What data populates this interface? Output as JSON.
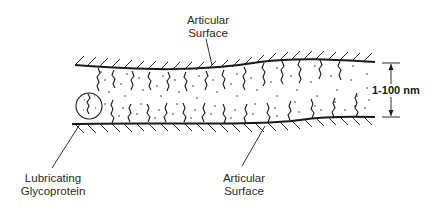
{
  "diagram": {
    "type": "boundary-lubrication-cross-section",
    "labels": {
      "top_surface": [
        "Articular",
        "Surface"
      ],
      "bottom_surface": [
        "Articular",
        "Surface"
      ],
      "glycoprotein": [
        "Lubricating",
        "Glycoprotein"
      ],
      "gap_dimension": "1-100 nm"
    },
    "colors": {
      "ink": "#1a1a1a",
      "text": "#2a2a2a",
      "background": "#ffffff"
    }
  }
}
